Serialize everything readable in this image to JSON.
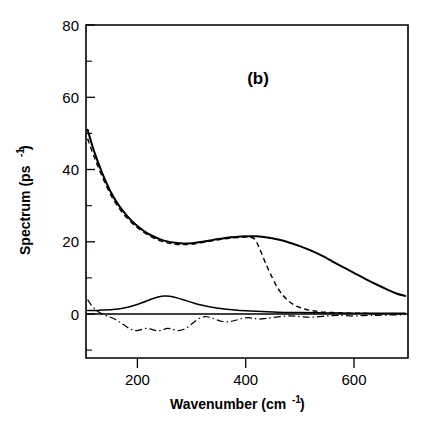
{
  "chart_data": {
    "type": "line",
    "title": "",
    "panel_label": "(b)",
    "xlabel": "Wavenumber (cm",
    "xlabel_sup": "-1",
    "xlabel_tail": " )",
    "ylabel": "Spectrum (ps",
    "ylabel_sup": "-1",
    "ylabel_tail": " )",
    "xlim": [
      105,
      700
    ],
    "ylim": [
      -12,
      80
    ],
    "xticks": [
      200,
      400,
      600
    ],
    "xtick_labels": [
      "200",
      "400",
      "600"
    ],
    "yticks": [
      0,
      20,
      40,
      60,
      80
    ],
    "ytick_labels": [
      "0",
      "20",
      "40",
      "60",
      "80"
    ],
    "y_minor_ticks": [
      10,
      30,
      50,
      70
    ],
    "grid": false,
    "legend": "none",
    "zero_reference_line": 0,
    "series": [
      {
        "name": "total-spectrum-solid",
        "style": "solid",
        "x": [
          108,
          120,
          135,
          150,
          165,
          180,
          195,
          210,
          225,
          240,
          255,
          270,
          285,
          300,
          320,
          340,
          360,
          380,
          400,
          420,
          440,
          460,
          480,
          500,
          520,
          540,
          560,
          580,
          600,
          620,
          640,
          660,
          680,
          695
        ],
        "y": [
          51.0,
          45.0,
          39.0,
          34.0,
          30.2,
          27.3,
          25.0,
          23.2,
          21.8,
          20.8,
          20.1,
          19.7,
          19.5,
          19.6,
          20.0,
          20.5,
          21.0,
          21.3,
          21.5,
          21.5,
          21.2,
          20.6,
          19.8,
          18.8,
          17.6,
          16.2,
          14.6,
          13.0,
          11.4,
          9.8,
          8.3,
          6.9,
          5.6,
          5.0
        ]
      },
      {
        "name": "component-spectrum-dashed",
        "style": "dashed",
        "x": [
          108,
          120,
          135,
          150,
          165,
          180,
          195,
          210,
          225,
          240,
          255,
          270,
          285,
          300,
          320,
          340,
          360,
          380,
          400,
          410,
          420,
          440,
          460,
          480,
          500,
          520,
          540,
          560,
          580,
          600,
          620,
          640,
          660,
          680,
          695
        ],
        "y": [
          48.5,
          43.5,
          38.0,
          33.2,
          29.5,
          26.7,
          24.5,
          22.8,
          21.4,
          20.4,
          19.7,
          19.3,
          19.2,
          19.3,
          19.8,
          20.3,
          20.8,
          21.1,
          21.3,
          21.2,
          20.0,
          13.0,
          7.0,
          3.5,
          1.8,
          1.0,
          0.6,
          0.4,
          0.3,
          0.2,
          0.2,
          0.1,
          0.1,
          0.1,
          0.1
        ]
      },
      {
        "name": "sub-band-solid",
        "style": "solid-thin",
        "x": [
          108,
          120,
          135,
          150,
          165,
          180,
          195,
          210,
          225,
          240,
          250,
          260,
          275,
          290,
          305,
          320,
          340,
          360,
          380,
          400,
          430,
          460,
          500,
          550,
          600,
          650,
          695
        ],
        "y": [
          1.0,
          1.0,
          1.1,
          1.2,
          1.4,
          1.8,
          2.4,
          3.2,
          4.1,
          4.8,
          5.0,
          4.9,
          4.4,
          3.7,
          3.0,
          2.4,
          1.8,
          1.4,
          1.1,
          0.9,
          0.7,
          0.5,
          0.4,
          0.3,
          0.2,
          0.2,
          0.2
        ]
      },
      {
        "name": "residual-dashdot",
        "style": "dashdot",
        "x": [
          108,
          115,
          125,
          135,
          145,
          155,
          165,
          175,
          185,
          195,
          205,
          215,
          225,
          235,
          245,
          255,
          265,
          275,
          285,
          295,
          305,
          315,
          325,
          335,
          345,
          355,
          365,
          375,
          385,
          395,
          405,
          415,
          425,
          440,
          460,
          480,
          500,
          520,
          545,
          570,
          600,
          630,
          660,
          695
        ],
        "y": [
          4.0,
          2.4,
          0.9,
          0.0,
          -0.6,
          -1.2,
          -2.0,
          -3.0,
          -4.0,
          -4.6,
          -4.4,
          -4.0,
          -4.2,
          -4.6,
          -4.5,
          -4.0,
          -4.2,
          -4.6,
          -4.3,
          -3.4,
          -2.2,
          -1.2,
          -0.7,
          -1.0,
          -1.5,
          -2.0,
          -2.2,
          -2.0,
          -1.6,
          -1.2,
          -1.0,
          -1.2,
          -1.4,
          -1.2,
          -0.8,
          -0.5,
          -0.7,
          -0.9,
          -0.6,
          -0.4,
          -0.5,
          -0.4,
          -0.3,
          -0.2
        ]
      }
    ]
  },
  "colors": {
    "axis": "#000000",
    "curve": "#000000",
    "background": "#ffffff"
  }
}
